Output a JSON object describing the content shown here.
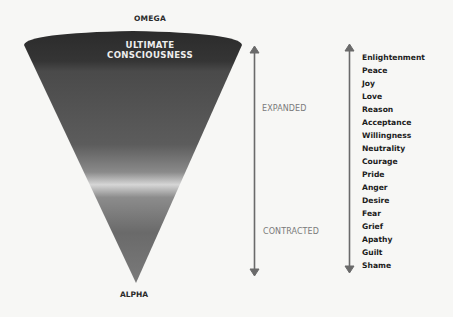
{
  "diagram": {
    "top_label": "OMEGA",
    "bottom_label": "ALPHA",
    "cone": {
      "title_line1": "ULTIMATE",
      "title_line2": "CONSCIOUSNESS",
      "colors": {
        "top": "#2e2e2e",
        "middle": "#5a5a5a",
        "highlight_band": "#d8d8d8",
        "bottom": "#6e6e6e"
      }
    },
    "axis": {
      "upper_label": "EXPANDED",
      "lower_label": "CONTRACTED",
      "arrow_color": "#6a6a6a"
    },
    "levels": [
      "Enlightenment",
      "Peace",
      "Joy",
      "Love",
      "Reason",
      "Acceptance",
      "Willingness",
      "Neutrality",
      "Courage",
      "Pride",
      "Anger",
      "Desire",
      "Fear",
      "Grief",
      "Apathy",
      "Guilt",
      "Shame"
    ]
  }
}
